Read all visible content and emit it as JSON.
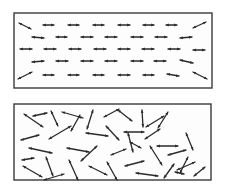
{
  "diagram": {
    "colors": {
      "background": "#ffffff",
      "frame": "#3a3a3a",
      "arrow": "#2a2a2a"
    },
    "panels": [
      {
        "name": "ordered-panel",
        "frame": {
          "x": 14,
          "y": 13,
          "w": 198,
          "h": 75
        },
        "arrows": [
          [
            19,
            23,
            31,
            29
          ],
          [
            43,
            25,
            54,
            25
          ],
          [
            68,
            25,
            79,
            25
          ],
          [
            93,
            25,
            104,
            25
          ],
          [
            118,
            25,
            130,
            25
          ],
          [
            143,
            25,
            154,
            25
          ],
          [
            166,
            25,
            177,
            25
          ],
          [
            193,
            28,
            206,
            22
          ],
          [
            32,
            37,
            44,
            38
          ],
          [
            56,
            37,
            67,
            37
          ],
          [
            81,
            37,
            93,
            37
          ],
          [
            105,
            37,
            117,
            37
          ],
          [
            131,
            37,
            143,
            37
          ],
          [
            155,
            37,
            167,
            37
          ],
          [
            180,
            38,
            192,
            37
          ],
          [
            20,
            49,
            32,
            49
          ],
          [
            44,
            49,
            56,
            49
          ],
          [
            69,
            49,
            81,
            49
          ],
          [
            94,
            49,
            106,
            49
          ],
          [
            118,
            49,
            130,
            49
          ],
          [
            142,
            49,
            154,
            49
          ],
          [
            168,
            49,
            180,
            49
          ],
          [
            193,
            50,
            205,
            50
          ],
          [
            32,
            62,
            44,
            61
          ],
          [
            56,
            61,
            68,
            61
          ],
          [
            81,
            61,
            93,
            61
          ],
          [
            105,
            61,
            117,
            61
          ],
          [
            131,
            61,
            143,
            61
          ],
          [
            154,
            61,
            166,
            61
          ],
          [
            180,
            60,
            193,
            63
          ],
          [
            18,
            79,
            32,
            72
          ],
          [
            43,
            75,
            54,
            75
          ],
          [
            68,
            75,
            79,
            75
          ],
          [
            93,
            75,
            104,
            75
          ],
          [
            118,
            75,
            130,
            75
          ],
          [
            143,
            75,
            154,
            75
          ],
          [
            167,
            74,
            179,
            76
          ],
          [
            193,
            72,
            207,
            79
          ]
        ]
      },
      {
        "name": "disordered-panel",
        "frame": {
          "x": 14,
          "y": 104,
          "w": 197,
          "h": 76
        },
        "arrows": [
          [
            24,
            114,
            43,
            127
          ],
          [
            33,
            116,
            47,
            113
          ],
          [
            51,
            111,
            58,
            126
          ],
          [
            62,
            112,
            83,
            118
          ],
          [
            93,
            110,
            87,
            129
          ],
          [
            104,
            117,
            119,
            109
          ],
          [
            118,
            110,
            132,
            121
          ],
          [
            142,
            110,
            143,
            127
          ],
          [
            146,
            127,
            164,
            116
          ],
          [
            168,
            112,
            158,
            128
          ],
          [
            21,
            140,
            39,
            135
          ],
          [
            49,
            139,
            71,
            126
          ],
          [
            71,
            131,
            80,
            115
          ],
          [
            86,
            133,
            108,
            136
          ],
          [
            106,
            126,
            119,
            140
          ],
          [
            124,
            132,
            144,
            132
          ],
          [
            145,
            139,
            160,
            129
          ],
          [
            130,
            142,
            141,
            148
          ],
          [
            157,
            146,
            178,
            146
          ],
          [
            186,
            133,
            193,
            150
          ],
          [
            29,
            148,
            52,
            153
          ],
          [
            67,
            148,
            89,
            152
          ],
          [
            81,
            161,
            97,
            146
          ],
          [
            111,
            155,
            126,
            149
          ],
          [
            128,
            133,
            133,
            152
          ],
          [
            150,
            146,
            162,
            165
          ],
          [
            168,
            155,
            186,
            150
          ],
          [
            188,
            157,
            180,
            173
          ],
          [
            22,
            160,
            34,
            158
          ],
          [
            46,
            157,
            53,
            176
          ],
          [
            23,
            166,
            42,
            177
          ],
          [
            69,
            160,
            78,
            180
          ],
          [
            89,
            166,
            107,
            175
          ],
          [
            107,
            162,
            117,
            180
          ],
          [
            125,
            166,
            144,
            161
          ],
          [
            136,
            173,
            158,
            176
          ],
          [
            44,
            180,
            64,
            174
          ],
          [
            175,
            172,
            184,
            174
          ],
          [
            164,
            178,
            174,
            164
          ],
          [
            177,
            170,
            195,
            162
          ],
          [
            194,
            176,
            205,
            167
          ]
        ]
      }
    ]
  }
}
